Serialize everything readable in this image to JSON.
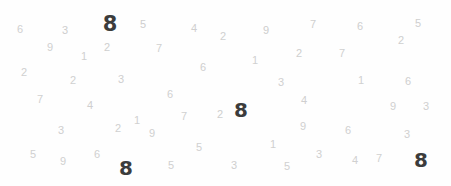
{
  "image": {
    "title": "Digit Scatter Visualization",
    "width": 451,
    "height": 186,
    "background_color": "#fefefe",
    "faint_digit_color": "#c9c9c9",
    "bold_digit_color": "#3c3c3c"
  },
  "chart_data": {
    "type": "scatter",
    "title": "",
    "subtitle": "",
    "xlabel": "",
    "ylabel": "",
    "xlim": [
      0,
      451
    ],
    "ylim": [
      0,
      186
    ],
    "grid": false,
    "legend": null,
    "annotations": [],
    "marker_style": "text-glyph",
    "classes": [
      {
        "name": "faint",
        "color": "#c9c9c9",
        "weight": "normal",
        "count": 57
      },
      {
        "name": "bold",
        "color": "#3c3c3c",
        "weight": "bold",
        "count": 4
      }
    ],
    "points": [
      {
        "label": "6",
        "x": 20,
        "y": 29,
        "size": 11,
        "opacity": 0.85,
        "style": "faint"
      },
      {
        "label": "3",
        "x": 65,
        "y": 30,
        "size": 11,
        "opacity": 0.9,
        "style": "faint"
      },
      {
        "label": "8",
        "x": 110,
        "y": 24,
        "size": 21,
        "opacity": 1.0,
        "style": "bold"
      },
      {
        "label": "5",
        "x": 143,
        "y": 24,
        "size": 11,
        "opacity": 0.9,
        "style": "faint"
      },
      {
        "label": "4",
        "x": 194,
        "y": 28,
        "size": 11,
        "opacity": 0.88,
        "style": "faint"
      },
      {
        "label": "2",
        "x": 223,
        "y": 36,
        "size": 11,
        "opacity": 0.85,
        "style": "faint"
      },
      {
        "label": "9",
        "x": 266,
        "y": 30,
        "size": 11,
        "opacity": 0.9,
        "style": "faint"
      },
      {
        "label": "7",
        "x": 313,
        "y": 24,
        "size": 11,
        "opacity": 0.88,
        "style": "faint"
      },
      {
        "label": "6",
        "x": 360,
        "y": 26,
        "size": 11,
        "opacity": 0.88,
        "style": "faint"
      },
      {
        "label": "5",
        "x": 418,
        "y": 23,
        "size": 11,
        "opacity": 0.88,
        "style": "faint"
      },
      {
        "label": "9",
        "x": 50,
        "y": 47,
        "size": 11,
        "opacity": 0.85,
        "style": "faint"
      },
      {
        "label": "1",
        "x": 84,
        "y": 56,
        "size": 11,
        "opacity": 0.85,
        "style": "faint"
      },
      {
        "label": "2",
        "x": 107,
        "y": 47,
        "size": 11,
        "opacity": 0.88,
        "style": "faint"
      },
      {
        "label": "7",
        "x": 159,
        "y": 48,
        "size": 11,
        "opacity": 0.85,
        "style": "faint"
      },
      {
        "label": "1",
        "x": 255,
        "y": 60,
        "size": 11,
        "opacity": 0.85,
        "style": "faint"
      },
      {
        "label": "2",
        "x": 299,
        "y": 53,
        "size": 11,
        "opacity": 0.88,
        "style": "faint"
      },
      {
        "label": "7",
        "x": 342,
        "y": 53,
        "size": 11,
        "opacity": 0.85,
        "style": "faint"
      },
      {
        "label": "2",
        "x": 401,
        "y": 40,
        "size": 11,
        "opacity": 0.88,
        "style": "faint"
      },
      {
        "label": "2",
        "x": 24,
        "y": 72,
        "size": 11,
        "opacity": 0.85,
        "style": "faint"
      },
      {
        "label": "2",
        "x": 73,
        "y": 80,
        "size": 11,
        "opacity": 0.85,
        "style": "faint"
      },
      {
        "label": "3",
        "x": 121,
        "y": 79,
        "size": 11,
        "opacity": 0.88,
        "style": "faint"
      },
      {
        "label": "6",
        "x": 203,
        "y": 67,
        "size": 11,
        "opacity": 0.88,
        "style": "faint"
      },
      {
        "label": "3",
        "x": 281,
        "y": 82,
        "size": 11,
        "opacity": 0.85,
        "style": "faint"
      },
      {
        "label": "1",
        "x": 361,
        "y": 80,
        "size": 11,
        "opacity": 0.85,
        "style": "faint"
      },
      {
        "label": "6",
        "x": 408,
        "y": 81,
        "size": 11,
        "opacity": 0.88,
        "style": "faint"
      },
      {
        "label": "7",
        "x": 40,
        "y": 99,
        "size": 11,
        "opacity": 0.85,
        "style": "faint"
      },
      {
        "label": "4",
        "x": 90,
        "y": 105,
        "size": 11,
        "opacity": 0.88,
        "style": "faint"
      },
      {
        "label": "6",
        "x": 170,
        "y": 94,
        "size": 11,
        "opacity": 0.85,
        "style": "faint"
      },
      {
        "label": "4",
        "x": 304,
        "y": 100,
        "size": 11,
        "opacity": 0.88,
        "style": "faint"
      },
      {
        "label": "9",
        "x": 393,
        "y": 106,
        "size": 11,
        "opacity": 0.85,
        "style": "faint"
      },
      {
        "label": "3",
        "x": 426,
        "y": 106,
        "size": 11,
        "opacity": 0.85,
        "style": "faint"
      },
      {
        "label": "7",
        "x": 184,
        "y": 116,
        "size": 11,
        "opacity": 0.85,
        "style": "faint"
      },
      {
        "label": "2",
        "x": 220,
        "y": 114,
        "size": 11,
        "opacity": 0.88,
        "style": "faint"
      },
      {
        "label": "8",
        "x": 241,
        "y": 110,
        "size": 20,
        "opacity": 1.0,
        "style": "bold"
      },
      {
        "label": "1",
        "x": 137,
        "y": 120,
        "size": 11,
        "opacity": 0.85,
        "style": "faint"
      },
      {
        "label": "2",
        "x": 118,
        "y": 128,
        "size": 11,
        "opacity": 0.85,
        "style": "faint"
      },
      {
        "label": "9",
        "x": 152,
        "y": 133,
        "size": 11,
        "opacity": 0.85,
        "style": "faint"
      },
      {
        "label": "3",
        "x": 61,
        "y": 130,
        "size": 11,
        "opacity": 0.88,
        "style": "faint"
      },
      {
        "label": "9",
        "x": 303,
        "y": 126,
        "size": 11,
        "opacity": 0.85,
        "style": "faint"
      },
      {
        "label": "6",
        "x": 348,
        "y": 130,
        "size": 11,
        "opacity": 0.85,
        "style": "faint"
      },
      {
        "label": "3",
        "x": 407,
        "y": 134,
        "size": 11,
        "opacity": 0.85,
        "style": "faint"
      },
      {
        "label": "5",
        "x": 33,
        "y": 154,
        "size": 11,
        "opacity": 0.85,
        "style": "faint"
      },
      {
        "label": "9",
        "x": 63,
        "y": 161,
        "size": 11,
        "opacity": 0.85,
        "style": "faint"
      },
      {
        "label": "6",
        "x": 97,
        "y": 154,
        "size": 11,
        "opacity": 0.85,
        "style": "faint"
      },
      {
        "label": "8",
        "x": 126,
        "y": 168,
        "size": 20,
        "opacity": 1.0,
        "style": "bold"
      },
      {
        "label": "5",
        "x": 171,
        "y": 165,
        "size": 11,
        "opacity": 0.85,
        "style": "faint"
      },
      {
        "label": "5",
        "x": 199,
        "y": 147,
        "size": 11,
        "opacity": 0.85,
        "style": "faint"
      },
      {
        "label": "3",
        "x": 234,
        "y": 165,
        "size": 11,
        "opacity": 0.88,
        "style": "faint"
      },
      {
        "label": "1",
        "x": 273,
        "y": 144,
        "size": 11,
        "opacity": 0.85,
        "style": "faint"
      },
      {
        "label": "5",
        "x": 287,
        "y": 166,
        "size": 11,
        "opacity": 0.85,
        "style": "faint"
      },
      {
        "label": "3",
        "x": 319,
        "y": 154,
        "size": 11,
        "opacity": 0.85,
        "style": "faint"
      },
      {
        "label": "4",
        "x": 355,
        "y": 160,
        "size": 11,
        "opacity": 0.85,
        "style": "faint"
      },
      {
        "label": "7",
        "x": 379,
        "y": 158,
        "size": 11,
        "opacity": 0.85,
        "style": "faint"
      },
      {
        "label": "8",
        "x": 421,
        "y": 160,
        "size": 20,
        "opacity": 1.0,
        "style": "bold"
      }
    ]
  }
}
